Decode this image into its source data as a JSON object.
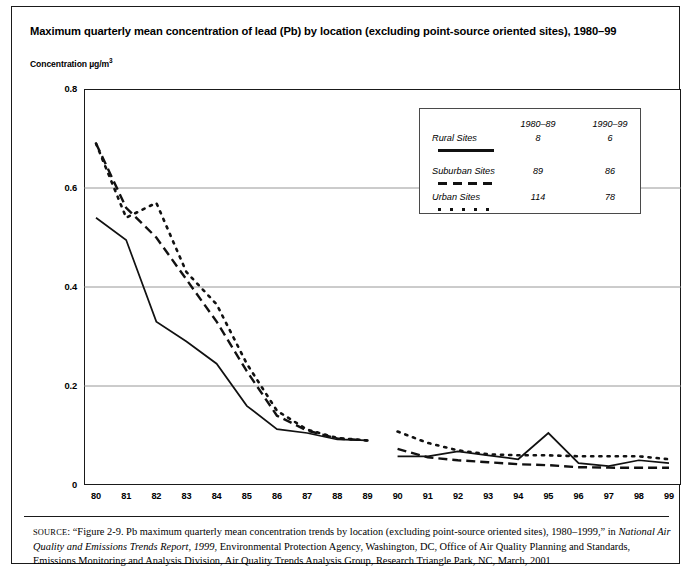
{
  "figure": {
    "title": "Maximum quarterly mean concentration of lead (Pb) by location (excluding point-source oriented sites), 1980–99",
    "y_axis_title_main": "Concentration µg/m",
    "y_axis_title_sup": "3"
  },
  "legend": {
    "col_headers": [
      "1980–89",
      "1990–99"
    ],
    "rows": [
      {
        "label": "Rural Sites",
        "v1": "8",
        "v2": "6",
        "style": "solid"
      },
      {
        "label": "Suburban Sites",
        "v1": "89",
        "v2": "86",
        "style": "dashed"
      },
      {
        "label": "Urban Sites",
        "v1": "114",
        "v2": "78",
        "style": "dotted"
      }
    ]
  },
  "source": {
    "caps": "SOURCE",
    "text_1": ": “Figure 2-9. Pb maximum quarterly mean concentration trends by location (excluding point-source oriented sites), 1980–1999,” in ",
    "italic_1": "National Air Quality and Emissions Trends Report, 1999",
    "text_2": ", Environmental Protection Agency, Washington, DC, Office of Air Quality Planning and Standards, Emissions Monitoring and Analysis Division, Air Quality Trends Analysis Group, Research Triangle Park, NC, March, 2001"
  },
  "chart_data": {
    "type": "line",
    "title": "Maximum quarterly mean concentration of lead (Pb) by location (excluding point-source oriented sites), 1980–99",
    "xlabel": "",
    "ylabel": "Concentration µg/m3",
    "x": [
      "80",
      "81",
      "82",
      "83",
      "84",
      "85",
      "86",
      "87",
      "88",
      "89",
      "90",
      "91",
      "92",
      "93",
      "94",
      "95",
      "96",
      "97",
      "98",
      "99"
    ],
    "xtick_labels": [
      "80",
      "81",
      "82",
      "83",
      "84",
      "85",
      "86",
      "87",
      "88",
      "89",
      "90",
      "91",
      "92",
      "93",
      "94",
      "95",
      "96",
      "97",
      "98",
      "99"
    ],
    "ytick_labels": [
      "0",
      "0.2",
      "0.4",
      "0.6",
      "0.8"
    ],
    "ytick_values": [
      0,
      0.2,
      0.4,
      0.6,
      0.8
    ],
    "ylim": [
      0,
      0.8
    ],
    "grid": "horizontal",
    "legend_position": "inside-top-right",
    "series": [
      {
        "name": "Rural Sites",
        "style": "solid",
        "sites_1980_89": 8,
        "sites_1990_99": 6,
        "segments": [
          {
            "period": "1980-89",
            "x": [
              "80",
              "81",
              "82",
              "83",
              "84",
              "85",
              "86",
              "87",
              "88",
              "89"
            ],
            "values": [
              0.54,
              0.495,
              0.33,
              0.29,
              0.245,
              0.16,
              0.113,
              0.105,
              0.092,
              0.09
            ]
          },
          {
            "period": "1990-99",
            "x": [
              "90",
              "91",
              "92",
              "93",
              "94",
              "95",
              "96",
              "97",
              "98",
              "99"
            ],
            "values": [
              0.058,
              0.058,
              0.068,
              0.06,
              0.052,
              0.105,
              0.044,
              0.038,
              0.05,
              0.044
            ]
          }
        ]
      },
      {
        "name": "Suburban Sites",
        "style": "dashed",
        "sites_1980_89": 89,
        "sites_1990_99": 86,
        "segments": [
          {
            "period": "1980-89",
            "x": [
              "80",
              "81",
              "82",
              "83",
              "84",
              "85",
              "86",
              "87",
              "88",
              "89"
            ],
            "values": [
              0.69,
              0.56,
              0.5,
              0.415,
              0.33,
              0.23,
              0.14,
              0.11,
              0.094,
              0.09
            ]
          },
          {
            "period": "1990-99",
            "x": [
              "90",
              "91",
              "92",
              "93",
              "94",
              "95",
              "96",
              "97",
              "98",
              "99"
            ],
            "values": [
              0.073,
              0.056,
              0.05,
              0.046,
              0.042,
              0.04,
              0.036,
              0.035,
              0.035,
              0.035
            ]
          }
        ]
      },
      {
        "name": "Urban Sites",
        "style": "dotted",
        "sites_1980_89": 114,
        "sites_1990_99": 78,
        "segments": [
          {
            "period": "1980-89",
            "x": [
              "80",
              "81",
              "82",
              "83",
              "84",
              "85",
              "86",
              "87",
              "88",
              "89"
            ],
            "values": [
              0.69,
              0.54,
              0.57,
              0.43,
              0.365,
              0.245,
              0.15,
              0.112,
              0.095,
              0.09
            ]
          },
          {
            "period": "1990-99",
            "x": [
              "90",
              "91",
              "92",
              "93",
              "94",
              "95",
              "96",
              "97",
              "98",
              "99"
            ],
            "values": [
              0.108,
              0.085,
              0.07,
              0.062,
              0.06,
              0.06,
              0.058,
              0.058,
              0.058,
              0.052
            ]
          }
        ]
      }
    ]
  }
}
